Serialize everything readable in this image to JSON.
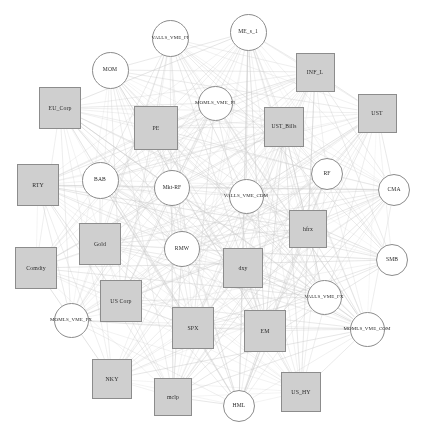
{
  "figure": {
    "type": "network-graph",
    "background_color": "#ffffff",
    "width": 423,
    "height": 434,
    "edge_color": "#c8c8c8",
    "square_fill": "#cfcfcf",
    "square_stroke": "#8c8c8c",
    "circle_fill": "#ffffff",
    "circle_stroke": "#8c8c8c",
    "label_color": "#2b2b2b"
  },
  "chart_data": {
    "type": "network",
    "title": "",
    "layout": "circular",
    "node_shapes": [
      "square",
      "circle"
    ],
    "node_count": 31,
    "edge_count": 330,
    "nodes": [
      {
        "id": "VALLS_VME_FI",
        "label": "VALLS_VME_FI",
        "shape": "circle",
        "x": 170,
        "y": 38,
        "size": 37,
        "font": 5.0
      },
      {
        "id": "ME_s_1",
        "label": "ME_s_1",
        "shape": "circle",
        "x": 248,
        "y": 32,
        "size": 37,
        "font": 5.6
      },
      {
        "id": "MOM",
        "label": "MOM",
        "shape": "circle",
        "x": 110,
        "y": 70,
        "size": 37,
        "font": 5.6
      },
      {
        "id": "INF_L",
        "label": "INF_L",
        "shape": "square",
        "x": 315,
        "y": 72,
        "size": 39,
        "font": 5.8
      },
      {
        "id": "MOMLS_VME_FI",
        "label": "MOMLS_VME_FI",
        "shape": "circle",
        "x": 215,
        "y": 103,
        "size": 35,
        "font": 5.0
      },
      {
        "id": "EU_Corp",
        "label": "EU_Corp",
        "shape": "square",
        "x": 60,
        "y": 108,
        "size": 42,
        "font": 5.8
      },
      {
        "id": "UST",
        "label": "UST",
        "shape": "square",
        "x": 377,
        "y": 113,
        "size": 39,
        "font": 5.8
      },
      {
        "id": "PE",
        "label": "PE",
        "shape": "square",
        "x": 156,
        "y": 128,
        "size": 44,
        "font": 5.8
      },
      {
        "id": "UST_Bills",
        "label": "UST_Bills",
        "shape": "square",
        "x": 284,
        "y": 127,
        "size": 40,
        "font": 5.6
      },
      {
        "id": "RF",
        "label": "RF",
        "shape": "circle",
        "x": 327,
        "y": 174,
        "size": 32,
        "font": 5.6
      },
      {
        "id": "RTY",
        "label": "RTY",
        "shape": "square",
        "x": 38,
        "y": 185,
        "size": 42,
        "font": 5.8
      },
      {
        "id": "BAB",
        "label": "BAB",
        "shape": "circle",
        "x": 100,
        "y": 180,
        "size": 37,
        "font": 5.6
      },
      {
        "id": "Mkt-RF",
        "label": "Mkt-RF",
        "shape": "circle",
        "x": 172,
        "y": 188,
        "size": 36,
        "font": 5.6
      },
      {
        "id": "VALLS_VME_CDM",
        "label": "VALLS_VME_CDM",
        "shape": "circle",
        "x": 246,
        "y": 196,
        "size": 35,
        "font": 5.0
      },
      {
        "id": "CMA",
        "label": "CMA",
        "shape": "circle",
        "x": 394,
        "y": 190,
        "size": 32,
        "font": 5.6
      },
      {
        "id": "Gold",
        "label": "Gold",
        "shape": "square",
        "x": 100,
        "y": 244,
        "size": 42,
        "font": 5.8
      },
      {
        "id": "RMW",
        "label": "RMW",
        "shape": "circle",
        "x": 182,
        "y": 249,
        "size": 36,
        "font": 5.6
      },
      {
        "id": "hfrx",
        "label": "hfrx",
        "shape": "square",
        "x": 308,
        "y": 229,
        "size": 38,
        "font": 5.8
      },
      {
        "id": "dxy",
        "label": "dxy",
        "shape": "square",
        "x": 243,
        "y": 268,
        "size": 40,
        "font": 5.8
      },
      {
        "id": "SMB",
        "label": "SMB",
        "shape": "circle",
        "x": 392,
        "y": 260,
        "size": 32,
        "font": 5.6
      },
      {
        "id": "Comdty",
        "label": "Comdty",
        "shape": "square",
        "x": 36,
        "y": 268,
        "size": 42,
        "font": 5.8
      },
      {
        "id": "VALLS_VME_FX",
        "label": "VALLS_VME_FX",
        "shape": "circle",
        "x": 324,
        "y": 297,
        "size": 35,
        "font": 5.0
      },
      {
        "id": "US Corp",
        "label": "US Corp",
        "shape": "square",
        "x": 121,
        "y": 301,
        "size": 42,
        "font": 5.8
      },
      {
        "id": "MOMLS_VME_FX",
        "label": "MOMLS_VME_FX",
        "shape": "circle",
        "x": 71,
        "y": 320,
        "size": 35,
        "font": 5.0
      },
      {
        "id": "SPX",
        "label": "SPX",
        "shape": "square",
        "x": 193,
        "y": 328,
        "size": 42,
        "font": 5.8
      },
      {
        "id": "EM",
        "label": "EM",
        "shape": "square",
        "x": 265,
        "y": 331,
        "size": 42,
        "font": 5.8
      },
      {
        "id": "MOMLS_VME_COM",
        "label": "MOMLS_VME_COM",
        "shape": "circle",
        "x": 367,
        "y": 329,
        "size": 35,
        "font": 5.0
      },
      {
        "id": "NKY",
        "label": "NKY",
        "shape": "square",
        "x": 112,
        "y": 379,
        "size": 40,
        "font": 5.8
      },
      {
        "id": "US_HY",
        "label": "US_HY",
        "shape": "square",
        "x": 301,
        "y": 392,
        "size": 40,
        "font": 5.8
      },
      {
        "id": "mclp",
        "label": "mclp",
        "shape": "square",
        "x": 173,
        "y": 397,
        "size": 38,
        "font": 5.8
      },
      {
        "id": "HML",
        "label": "HML",
        "shape": "circle",
        "x": 239,
        "y": 406,
        "size": 32,
        "font": 5.6
      }
    ],
    "xlabel": "",
    "ylabel": "",
    "legend": [],
    "grid": false
  }
}
